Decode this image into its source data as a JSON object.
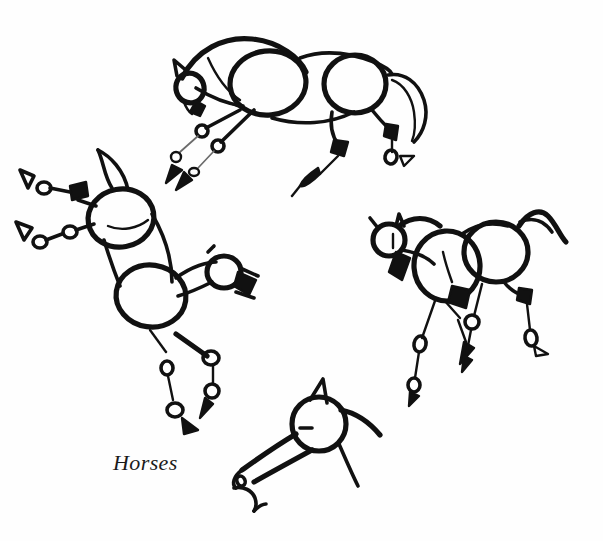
{
  "artwork": {
    "caption": "Horses",
    "medium_note": "gesture sketch",
    "background_color": "#fefefe",
    "ink_color": "#111111"
  },
  "figures": [
    {
      "id": "horse-top",
      "label": "horse-top-trotting",
      "position": "top-center"
    },
    {
      "id": "horse-left",
      "label": "horse-left-rearing",
      "position": "left"
    },
    {
      "id": "horse-right",
      "label": "horse-right-galloping",
      "position": "right"
    },
    {
      "id": "horse-bottom",
      "label": "horse-bottom-head-study",
      "position": "bottom-center"
    }
  ]
}
